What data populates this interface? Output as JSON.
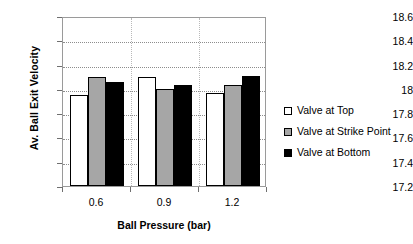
{
  "chart_data": {
    "type": "bar",
    "title": "",
    "categories": [
      "0.6",
      "0.9",
      "1.2"
    ],
    "series": [
      {
        "name": "Valve at Top",
        "values": [
          17.95,
          18.1,
          17.97
        ],
        "color": "#ffffff"
      },
      {
        "name": "Valve at Strike Point",
        "values": [
          18.1,
          18.0,
          18.03
        ],
        "color": "#a6a6a6"
      },
      {
        "name": "Valve at Bottom",
        "values": [
          18.06,
          18.03,
          18.11
        ],
        "color": "#000000"
      }
    ],
    "xlabel": "Ball Pressure (bar)",
    "ylabel": "Av. Ball Exit Velocity",
    "ylim": [
      17.2,
      18.6
    ],
    "yticks": [
      "17.2",
      "17.4",
      "17.6",
      "17.8",
      "18",
      "18.2",
      "18.4",
      "18.6"
    ],
    "ytick_values": [
      17.2,
      17.4,
      17.6,
      17.8,
      18.0,
      18.2,
      18.4,
      18.6
    ],
    "grid": true,
    "legend_position": "right"
  }
}
